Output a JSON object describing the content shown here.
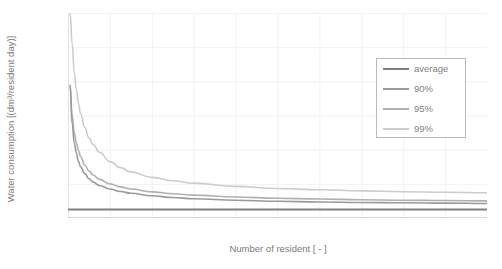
{
  "chart_data": {
    "type": "line",
    "title": "",
    "xlabel": "Number of resident [ - ]",
    "ylabel": "Water consumption [(dm³/resident day)]",
    "xlim": [
      0,
      200
    ],
    "ylim": [
      105,
      225
    ],
    "xticks": [
      0,
      20,
      40,
      60,
      80,
      100,
      120,
      140,
      160,
      180,
      200
    ],
    "yticks": [
      105,
      125,
      145,
      165,
      185,
      205,
      225
    ],
    "grid": true,
    "legend_position": "inside-top-right",
    "series": [
      {
        "name": "average",
        "color": "#808080",
        "width": 2.0,
        "x": [
          0,
          1,
          2,
          5,
          10,
          20,
          40,
          60,
          80,
          100,
          120,
          140,
          160,
          180,
          200
        ],
        "values": [
          110,
          110,
          110,
          110,
          110,
          110,
          110,
          110,
          110,
          110,
          110,
          110,
          110,
          110,
          110
        ]
      },
      {
        "name": "90%",
        "color": "#9a9a9a",
        "width": 1.6,
        "x": [
          1,
          2,
          3,
          4,
          5,
          6,
          8,
          10,
          12,
          15,
          20,
          25,
          30,
          40,
          50,
          60,
          80,
          100,
          120,
          140,
          160,
          180,
          200
        ],
        "values": [
          182,
          160,
          149,
          143,
          138,
          135,
          131,
          128,
          126,
          124,
          122,
          120.5,
          119.5,
          118,
          117,
          116.3,
          115.4,
          114.8,
          114.4,
          114.1,
          113.9,
          113.7,
          113.5
        ]
      },
      {
        "name": "95%",
        "color": "#b0b0b0",
        "width": 1.6,
        "x": [
          1,
          2,
          3,
          4,
          5,
          6,
          8,
          10,
          12,
          15,
          20,
          25,
          30,
          40,
          50,
          60,
          80,
          100,
          120,
          140,
          160,
          180,
          200
        ],
        "values": [
          183,
          165,
          155,
          149,
          144.5,
          141,
          136,
          132.5,
          130.2,
          127.6,
          125,
          123.2,
          122,
          120.3,
          119.2,
          118.4,
          117.3,
          116.6,
          116.1,
          115.7,
          115.4,
          115.2,
          115.0
        ]
      },
      {
        "name": "99%",
        "color": "#cccccc",
        "width": 1.6,
        "x": [
          1,
          2,
          3,
          4,
          5,
          6,
          8,
          10,
          12,
          15,
          20,
          25,
          30,
          40,
          50,
          60,
          80,
          100,
          120,
          140,
          160,
          180,
          200
        ],
        "values": [
          225,
          207,
          190,
          180,
          172,
          166,
          158,
          152,
          148,
          143.5,
          138,
          134.5,
          132,
          128.8,
          126.8,
          125.4,
          123.5,
          122.3,
          121.5,
          120.9,
          120.4,
          120.1,
          119.8
        ]
      }
    ]
  },
  "legend": {
    "items": [
      {
        "label": "average"
      },
      {
        "label": "90%"
      },
      {
        "label": "95%"
      },
      {
        "label": "99%"
      }
    ]
  }
}
